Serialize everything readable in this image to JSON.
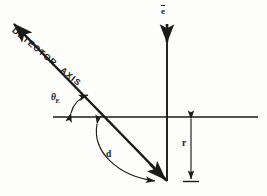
{
  "figure": {
    "kind": "scientific-line-diagram",
    "background_color": "#fdfdfc",
    "ink_color": "#1a1a1a",
    "width": 267,
    "height": 196
  },
  "labels": {
    "detector_axis_part1": "DETECTOR",
    "detector_axis_part2": "AXIS",
    "theta_symbol": "θ",
    "theta_subscript": "E",
    "electron": "e",
    "distance": "d",
    "radius": "r"
  },
  "elements": {
    "detector_axis_arrow": "detector-axis-arrow",
    "electron_beam_arrow": "electron-beam-arrow",
    "horizontal_reference_line": "horizontal-reference-line",
    "vertical_beam_line": "vertical-beam-line",
    "angle_arc_arrow": "angle-arc-arrow",
    "distance_arc_arrow": "distance-arc-arrow",
    "radius_dimension_arrow": "radius-dimension-arrow"
  },
  "geometry": {
    "horizontal_line_y": 117,
    "horizontal_line_x_start": 53,
    "horizontal_line_x_end": 258,
    "vertical_line_x": 167,
    "vertical_line_y_top": 24,
    "vertical_line_y_bottom": 181,
    "detector_axis_tip_x": 12,
    "detector_axis_tip_y": 22,
    "detector_axis_base_x": 167,
    "detector_axis_base_y": 181,
    "radius_dimension_x": 191,
    "radius_dimension_y_top": 119,
    "radius_dimension_y_bottom": 181
  }
}
